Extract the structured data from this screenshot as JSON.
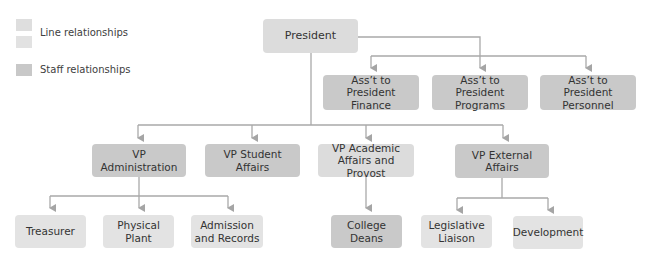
{
  "legend": {
    "items": [
      {
        "label": "Line relationships",
        "color": "#dddddd"
      },
      {
        "label": "Staff relationships",
        "color": "#c8c8c8"
      }
    ]
  },
  "colors": {
    "line_box": "#dcdcdc",
    "staff_box": "#c9c9c9",
    "connector": "#a9a9a9"
  },
  "chart": {
    "president": "President",
    "assistants": [
      {
        "label": "Ass’t to President\nFinance"
      },
      {
        "label": "Ass’t to President\nPrograms"
      },
      {
        "label": "Ass’t to President\nPersonnel"
      }
    ],
    "vps": [
      {
        "label": "VP\nAdministration"
      },
      {
        "label": "VP Student\nAffairs"
      },
      {
        "label": "VP Academic\nAffairs and Provost"
      },
      {
        "label": "VP External\nAffairs"
      }
    ],
    "units": [
      {
        "label": "Treasurer",
        "reports_to": "VP Administration"
      },
      {
        "label": "Physical\nPlant",
        "reports_to": "VP Administration"
      },
      {
        "label": "Admission\nand Records",
        "reports_to": "VP Administration"
      },
      {
        "label": "College\nDeans",
        "reports_to": "VP Academic Affairs and Provost"
      },
      {
        "label": "Legislative\nLiaison",
        "reports_to": "VP External Affairs"
      },
      {
        "label": "Development",
        "reports_to": "VP External Affairs"
      }
    ]
  }
}
